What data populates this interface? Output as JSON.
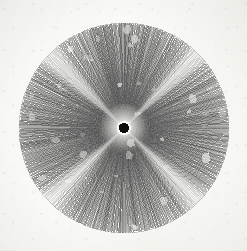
{
  "figure": {
    "medium": "engraving scan",
    "caption": ""
  },
  "canvas": {
    "width": 247,
    "height": 251,
    "background_color": "#f8f8f6",
    "paper_tint": "#f2f1ec"
  },
  "chart_data": {
    "type": "scatter",
    "subtitle": "",
    "xlabel": "",
    "ylabel": "",
    "grid": false,
    "legend_position": "none",
    "xlim": [
      0,
      247
    ],
    "ylim": [
      0,
      251
    ],
    "disc": {
      "center_x": 124,
      "center_y": 128,
      "radius": 105,
      "ray_count": 720,
      "ray_inner_radius": 7,
      "ray_color": "#23221f",
      "ray_width": 0.62,
      "rim_color": "#3a3834"
    },
    "center_dot": {
      "center_x": 124,
      "center_y": 128,
      "radius": 5.2,
      "color": "#0d0d0c"
    },
    "seam_angles_deg": [
      45,
      135,
      225,
      315
    ],
    "annotations": []
  },
  "colors": {
    "ink": "#23221f",
    "dot": "#0d0d0c",
    "paper": "#f8f8f6",
    "stain": "#e9e7e0"
  }
}
